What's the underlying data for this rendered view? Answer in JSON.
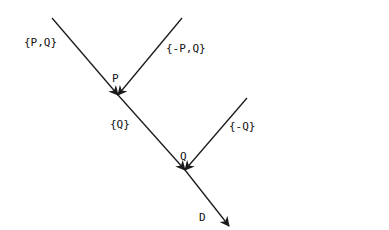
{
  "diagram": {
    "type": "flow-merge",
    "nodes": [
      {
        "id": "P",
        "label": "P"
      },
      {
        "id": "Q",
        "label": "Q"
      },
      {
        "id": "D",
        "label": "D"
      }
    ],
    "edges": [
      {
        "id": "in-main",
        "label": "{P,Q}",
        "to": "P"
      },
      {
        "id": "in-notP",
        "label": "{-P,Q}",
        "to": "P"
      },
      {
        "id": "P-to-Q",
        "label": "{Q}",
        "from": "P",
        "to": "Q"
      },
      {
        "id": "in-notQ",
        "label": "{-Q}",
        "to": "Q"
      },
      {
        "id": "Q-to-D",
        "label": "",
        "from": "Q",
        "to": "D"
      }
    ]
  },
  "labels": {
    "pq": "{P,Q}",
    "npq": "{-P,Q}",
    "p": "P",
    "q_set": "{Q}",
    "nq": "{-Q}",
    "q": "Q",
    "d": "D"
  }
}
